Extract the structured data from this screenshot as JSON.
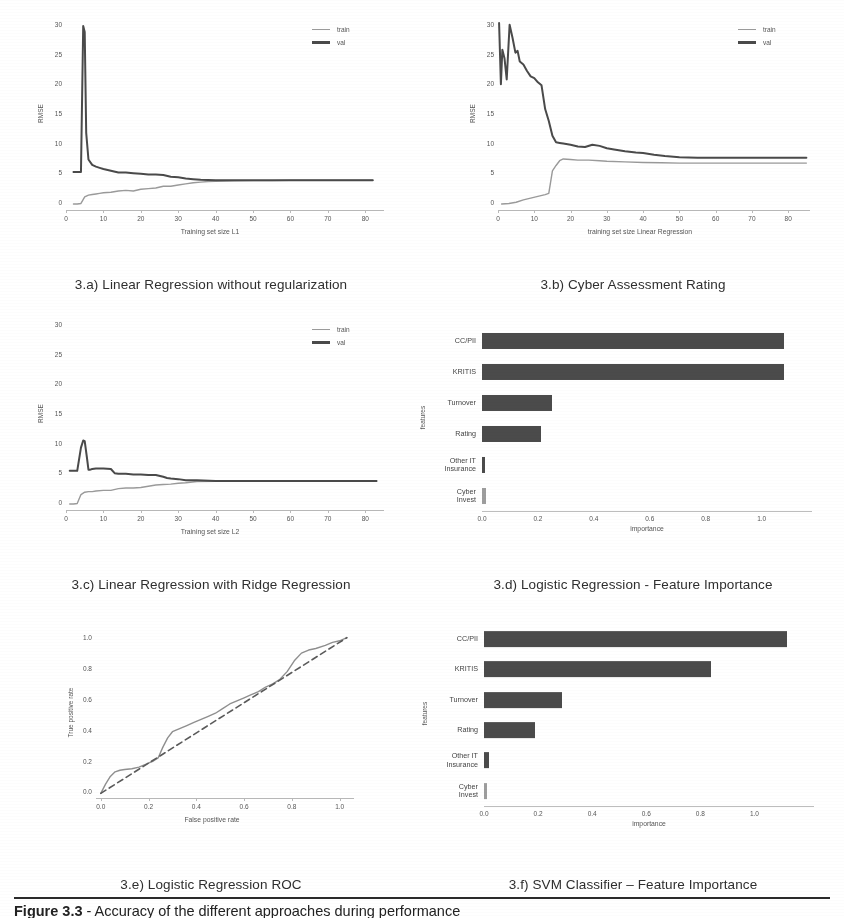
{
  "document": {
    "caption_label": "Figure 3.3",
    "caption_text": " - Accuracy of the different approaches during performance",
    "caption_full": "Figure 3.3 - Accuracy of the different approaches during performance"
  },
  "legend": {
    "train": "train",
    "val": "val"
  },
  "palette": {
    "train": "#9a9a9a",
    "val": "#4a4a4a",
    "bar": "#4b4b4b",
    "bar_faint": "#9d9d9d",
    "axis": "#bdbdbd",
    "text": "#555555",
    "caption": "#2f2f2f",
    "page_background": "#ffffff"
  },
  "figures": [
    {
      "id": "3a",
      "caption": "3.a) Linear Regression without regularization"
    },
    {
      "id": "3b",
      "caption": "3.b) Cyber Assessment Rating"
    },
    {
      "id": "3c",
      "caption": "3.c) Linear Regression with Ridge Regression"
    },
    {
      "id": "3d",
      "caption": "3.d) Logistic Regression - Feature Importance"
    },
    {
      "id": "3e",
      "caption": "3.e) Logistic Regression ROC"
    },
    {
      "id": "3f",
      "caption": "3.f) SVM Classifier – Feature Importance"
    }
  ],
  "chart_data": [
    {
      "id": "3a",
      "type": "line",
      "title": "3.a) Linear Regression without regularization",
      "xlabel": "Training set size L1",
      "ylabel": "RMSE",
      "xlim": [
        0,
        85
      ],
      "ylim": [
        -1,
        31
      ],
      "xticks": [
        0,
        10,
        20,
        30,
        40,
        50,
        60,
        70,
        80
      ],
      "yticks": [
        0,
        5,
        10,
        15,
        20,
        25,
        30
      ],
      "grid": false,
      "legend_position": "top-right",
      "series": [
        {
          "name": "train",
          "color": "#9a9a9a",
          "x": [
            2,
            3,
            4,
            5,
            6,
            7,
            8,
            9,
            10,
            12,
            14,
            16,
            18,
            20,
            22,
            24,
            26,
            28,
            30,
            32,
            34,
            36,
            38,
            40,
            45,
            50,
            55,
            60,
            65,
            70,
            75,
            80,
            82
          ],
          "y": [
            0.0,
            0.0,
            0.1,
            1.2,
            1.5,
            1.6,
            1.7,
            1.8,
            1.9,
            2.0,
            2.2,
            2.3,
            2.2,
            2.5,
            2.6,
            2.7,
            3.0,
            3.0,
            3.2,
            3.4,
            3.6,
            3.7,
            3.8,
            3.85,
            3.9,
            3.95,
            3.95,
            4.0,
            4.0,
            4.0,
            4.0,
            4.0,
            4.0
          ]
        },
        {
          "name": "val",
          "color": "#4a4a4a",
          "x": [
            2,
            3,
            4,
            4.6,
            5,
            5.4,
            6,
            7,
            8,
            9,
            10,
            12,
            14,
            16,
            18,
            20,
            22,
            24,
            26,
            28,
            30,
            32,
            34,
            36,
            38,
            40,
            45,
            50,
            55,
            60,
            65,
            70,
            75,
            80,
            82
          ],
          "y": [
            5.4,
            5.4,
            5.4,
            30.0,
            29.0,
            12.0,
            7.5,
            6.6,
            6.3,
            6.1,
            5.9,
            5.6,
            5.3,
            5.3,
            5.2,
            5.1,
            5.0,
            5.0,
            4.9,
            4.6,
            4.5,
            4.3,
            4.2,
            4.1,
            4.05,
            4.0,
            4.0,
            4.0,
            4.0,
            4.0,
            4.0,
            4.0,
            4.0,
            4.0,
            4.0
          ]
        }
      ]
    },
    {
      "id": "3b",
      "type": "line",
      "title": "3.b) Cyber Assessment Rating",
      "xlabel": "training set size Linear Regression",
      "ylabel": "RMSE",
      "xlim": [
        0,
        86
      ],
      "ylim": [
        -1,
        31
      ],
      "xticks": [
        0,
        10,
        20,
        30,
        40,
        50,
        60,
        70,
        80
      ],
      "yticks": [
        0,
        5,
        10,
        15,
        20,
        25,
        30
      ],
      "grid": false,
      "legend_position": "top-right",
      "series": [
        {
          "name": "train",
          "color": "#9a9a9a",
          "x": [
            1,
            3,
            5,
            7,
            9,
            11,
            13,
            14,
            15,
            16,
            17,
            18,
            20,
            22,
            25,
            28,
            30,
            35,
            40,
            45,
            50,
            55,
            60,
            65,
            70,
            75,
            80,
            85
          ],
          "y": [
            0.0,
            0.1,
            0.3,
            0.7,
            1.0,
            1.3,
            1.6,
            1.8,
            5.6,
            6.5,
            7.3,
            7.6,
            7.5,
            7.4,
            7.4,
            7.3,
            7.2,
            7.1,
            7.0,
            6.95,
            6.9,
            6.9,
            6.9,
            6.9,
            6.9,
            6.9,
            6.9,
            6.9
          ]
        },
        {
          "name": "val",
          "color": "#4a4a4a",
          "x": [
            0.3,
            0.8,
            1.2,
            1.8,
            2.4,
            3.2,
            4,
            4.8,
            5.4,
            6,
            7,
            8,
            9,
            10,
            11,
            12,
            13,
            14,
            15,
            16,
            17,
            18,
            20,
            22,
            24,
            26,
            28,
            30,
            32,
            35,
            38,
            40,
            43,
            46,
            50,
            55,
            60,
            65,
            70,
            75,
            80,
            85
          ],
          "y": [
            30.5,
            20.2,
            26.0,
            24.5,
            21.0,
            30.2,
            28.0,
            25.5,
            25.8,
            24.0,
            23.5,
            22.4,
            21.5,
            21.2,
            20.5,
            20.0,
            16.0,
            14.0,
            11.5,
            10.4,
            10.3,
            10.2,
            10.0,
            9.7,
            9.6,
            10.0,
            9.8,
            9.4,
            9.2,
            8.9,
            8.7,
            8.6,
            8.3,
            8.1,
            7.9,
            7.8,
            7.8,
            7.8,
            7.8,
            7.8,
            7.8,
            7.8
          ]
        }
      ]
    },
    {
      "id": "3c",
      "type": "line",
      "title": "3.c) Linear Regression with Ridge Regression",
      "xlabel": "Training set size L2",
      "ylabel": "RMSE",
      "xlim": [
        0,
        85
      ],
      "ylim": [
        -1,
        31
      ],
      "xticks": [
        0,
        10,
        20,
        30,
        40,
        50,
        60,
        70,
        80
      ],
      "yticks": [
        0,
        5,
        10,
        15,
        20,
        25,
        30
      ],
      "grid": false,
      "legend_position": "top-right",
      "series": [
        {
          "name": "train",
          "color": "#9a9a9a",
          "x": [
            1,
            2,
            3,
            4,
            5,
            6,
            7,
            8,
            10,
            12,
            14,
            16,
            18,
            20,
            22,
            24,
            26,
            28,
            30,
            32,
            35,
            40,
            45,
            50,
            55,
            60,
            65,
            70,
            75,
            80,
            83
          ],
          "y": [
            0.0,
            0.0,
            0.1,
            1.6,
            2.0,
            2.1,
            2.1,
            2.2,
            2.3,
            2.3,
            2.6,
            2.7,
            2.7,
            2.8,
            3.0,
            3.2,
            3.3,
            3.35,
            3.5,
            3.6,
            3.8,
            3.85,
            3.9,
            3.9,
            3.9,
            3.9,
            3.9,
            3.9,
            3.9,
            3.9,
            3.9
          ]
        },
        {
          "name": "val",
          "color": "#4a4a4a",
          "x": [
            1,
            2,
            3,
            4,
            4.6,
            5,
            5.6,
            6,
            6.5,
            7,
            8,
            10,
            12,
            13,
            14,
            16,
            18,
            20,
            22,
            24,
            26,
            27,
            28,
            30,
            32,
            35,
            40,
            45,
            50,
            55,
            60,
            65,
            70,
            75,
            80,
            83
          ],
          "y": [
            5.6,
            5.6,
            5.6,
            9.5,
            10.7,
            10.6,
            7.8,
            5.8,
            5.8,
            5.9,
            6.0,
            6.0,
            5.9,
            5.2,
            5.1,
            5.1,
            5.0,
            5.0,
            4.9,
            4.9,
            4.6,
            4.4,
            4.3,
            4.2,
            4.0,
            4.0,
            3.9,
            3.9,
            3.9,
            3.9,
            3.9,
            3.9,
            3.9,
            3.9,
            3.9,
            3.9
          ]
        }
      ]
    },
    {
      "id": "3d",
      "type": "bar",
      "orientation": "horizontal",
      "title": "3.d) Logistic Regression - Feature Importance",
      "xlabel": "importance",
      "ylabel": "features",
      "categories": [
        "CC/PII",
        "KRITIS",
        "Turnover",
        "Rating",
        "Other IT\nInsurance",
        "Cyber Invest"
      ],
      "values": [
        1.08,
        1.08,
        0.25,
        0.21,
        0.012,
        0.015
      ],
      "bar_colors": [
        "#4b4b4b",
        "#4b4b4b",
        "#4b4b4b",
        "#4b4b4b",
        "#4b4b4b",
        "#9d9d9d"
      ],
      "xlim": [
        0,
        1.18
      ],
      "xticks": [
        0.0,
        0.2,
        0.4,
        0.6,
        0.8,
        1.0
      ],
      "xticklabels": [
        "0.0",
        "0.2",
        "0.4",
        "0.6",
        "0.8",
        "1.0"
      ],
      "grid": false
    },
    {
      "id": "3e",
      "type": "line",
      "title": "3.e) Logistic Regression ROC",
      "xlabel": "False positive rate",
      "ylabel": "True positive rate",
      "xlim": [
        -0.02,
        1.06
      ],
      "ylim": [
        -0.03,
        1.06
      ],
      "xticks": [
        0.0,
        0.2,
        0.4,
        0.6,
        0.8,
        1.0
      ],
      "yticks": [
        0.0,
        0.2,
        0.4,
        0.6,
        0.8,
        1.0
      ],
      "xticklabels": [
        "0.0",
        "0.2",
        "0.4",
        "0.6",
        "0.8",
        "1.0"
      ],
      "yticklabels": [
        "0.0",
        "0.2",
        "0.4",
        "0.6",
        "0.8",
        "1.0"
      ],
      "grid": false,
      "series": [
        {
          "name": "roc",
          "style": "solid",
          "color": "#8f8f8f",
          "x": [
            0.0,
            0.02,
            0.04,
            0.06,
            0.08,
            0.1,
            0.13,
            0.16,
            0.19,
            0.22,
            0.24,
            0.26,
            0.28,
            0.3,
            0.33,
            0.36,
            0.39,
            0.42,
            0.45,
            0.48,
            0.51,
            0.54,
            0.57,
            0.6,
            0.63,
            0.66,
            0.69,
            0.72,
            0.75,
            0.78,
            0.81,
            0.84,
            0.87,
            0.9,
            0.94,
            0.97,
            1.0,
            1.03
          ],
          "y": [
            0.0,
            0.06,
            0.11,
            0.14,
            0.15,
            0.155,
            0.16,
            0.17,
            0.19,
            0.21,
            0.23,
            0.3,
            0.36,
            0.4,
            0.42,
            0.44,
            0.46,
            0.48,
            0.5,
            0.52,
            0.55,
            0.58,
            0.6,
            0.62,
            0.64,
            0.66,
            0.69,
            0.71,
            0.74,
            0.79,
            0.86,
            0.91,
            0.93,
            0.94,
            0.96,
            0.98,
            0.99,
            1.01
          ]
        },
        {
          "name": "chance",
          "style": "dashed",
          "color": "#5a5a5a",
          "x": [
            0.0,
            1.03
          ],
          "y": [
            0.0,
            1.01
          ]
        }
      ]
    },
    {
      "id": "3f",
      "type": "bar",
      "orientation": "horizontal",
      "title": "3.f) SVM Classifier – Feature Importance",
      "xlabel": "importance",
      "ylabel": "features",
      "categories": [
        "CC/PII",
        "KRITIS",
        "Turnover",
        "Rating",
        "Other IT\nInsurance",
        "Cyber Invest"
      ],
      "values": [
        1.12,
        0.84,
        0.29,
        0.19,
        0.018,
        0.006
      ],
      "bar_colors": [
        "#4b4b4b",
        "#4b4b4b",
        "#4b4b4b",
        "#4b4b4b",
        "#4b4b4b",
        "#9d9d9d"
      ],
      "xlim": [
        0,
        1.22
      ],
      "xticks": [
        0.0,
        0.2,
        0.4,
        0.6,
        0.8,
        1.0
      ],
      "xticklabels": [
        "0.0",
        "0.2",
        "0.4",
        "0.6",
        "0.8",
        "1.0"
      ],
      "grid": false
    }
  ]
}
